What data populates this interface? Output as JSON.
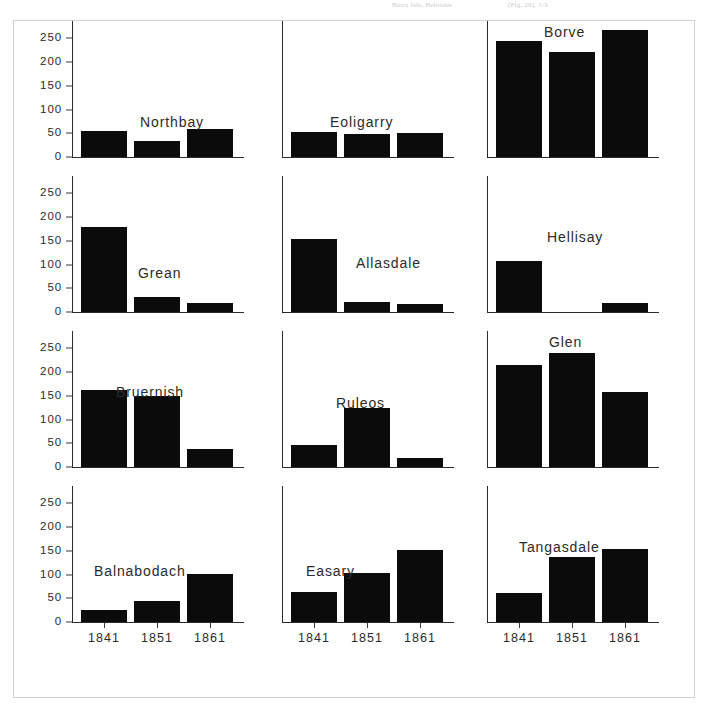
{
  "scan_header": {
    "fragment_left": "Barra Isle, Hebrides",
    "fragment_right": "(Fig. 20), 1/3"
  },
  "chart_data": {
    "type": "bar",
    "title": "",
    "subtitle": "",
    "xlabel": "",
    "ylabel": "",
    "categories": [
      "1841",
      "1851",
      "1861"
    ],
    "ylim": [
      0,
      270
    ],
    "yticks": [
      0,
      50,
      100,
      150,
      200,
      250
    ],
    "ytick_labels": [
      "0",
      "50",
      "100",
      "150",
      "200",
      "250"
    ],
    "grid": false,
    "legend": "none",
    "bar_color": "#0b0b0b",
    "axis_color": "#2b2b2b",
    "layout": {
      "rows": 4,
      "cols": 3
    },
    "panels": [
      {
        "name": "Northbay",
        "row": 0,
        "col": 0,
        "values": [
          55,
          34,
          59
        ],
        "title_x": 68,
        "title_y": 86
      },
      {
        "name": "Eoligarry",
        "row": 0,
        "col": 1,
        "values": [
          52,
          48,
          50
        ],
        "title_x": 48,
        "title_y": 86
      },
      {
        "name": "Borve",
        "row": 0,
        "col": 2,
        "values": [
          245,
          222,
          268
        ],
        "title_x": 57,
        "title_y": -4
      },
      {
        "name": "Grean",
        "row": 1,
        "col": 0,
        "values": [
          180,
          32,
          19
        ],
        "title_x": 66,
        "title_y": 82
      },
      {
        "name": "Allasdale",
        "row": 1,
        "col": 1,
        "values": [
          155,
          21,
          17
        ],
        "title_x": 74,
        "title_y": 72
      },
      {
        "name": "Hellisay",
        "row": 1,
        "col": 2,
        "values": [
          108,
          0,
          19
        ],
        "title_x": 60,
        "title_y": 46
      },
      {
        "name": "Bruernish",
        "row": 2,
        "col": 0,
        "values": [
          162,
          150,
          37
        ],
        "title_x": 44,
        "title_y": 46
      },
      {
        "name": "Ruleos",
        "row": 2,
        "col": 1,
        "values": [
          47,
          125,
          20
        ],
        "title_x": 54,
        "title_y": 57
      },
      {
        "name": "Glen",
        "row": 2,
        "col": 2,
        "values": [
          216,
          240,
          158
        ],
        "title_x": 62,
        "title_y": -4
      },
      {
        "name": "Balnabodach",
        "row": 3,
        "col": 0,
        "values": [
          26,
          45,
          102
        ],
        "title_x": 22,
        "title_y": 70
      },
      {
        "name": "Easary",
        "row": 3,
        "col": 1,
        "values": [
          64,
          103,
          152
        ],
        "title_x": 24,
        "title_y": 70
      },
      {
        "name": "Tangasdale",
        "row": 3,
        "col": 2,
        "values": [
          62,
          137,
          154
        ],
        "title_x": 32,
        "title_y": 46
      }
    ]
  }
}
